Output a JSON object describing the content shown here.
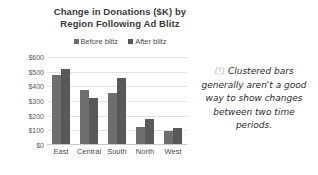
{
  "chart_data": {
    "type": "bar",
    "title": "Change in Donations ($K) by Region Following Ad Blitz",
    "title_line1": "Change in Donations ($K) by",
    "title_line2": "Region Following Ad Blitz",
    "xlabel": "",
    "ylabel": "",
    "categories": [
      "East",
      "Central",
      "South",
      "North",
      "West"
    ],
    "series": [
      {
        "name": "Before blitz",
        "color": "#6e6e6e",
        "values": [
          480,
          375,
          355,
          125,
          95
        ]
      },
      {
        "name": "After blitz",
        "color": "#595959",
        "values": [
          520,
          320,
          455,
          175,
          115
        ]
      }
    ],
    "ylim": [
      0,
      600
    ],
    "yticks": [
      0,
      100,
      200,
      300,
      400,
      500,
      600
    ],
    "ytick_labels": [
      "$0",
      "$100",
      "$200",
      "$300",
      "$400",
      "$500",
      "$600"
    ],
    "grid": true,
    "legend_position": "top"
  },
  "annotation": {
    "marker": "(!)",
    "text": "Clustered bars generally aren't a good way to show changes between two time periods."
  },
  "colors": {
    "grid": "#e2e2e2",
    "axis": "#c8c8c8",
    "text": "#4a4a4a",
    "title": "#3a3a3a",
    "annotation": "#2b2b2b",
    "annotation_marker": "#b9b9b9",
    "background": "#ffffff"
  }
}
